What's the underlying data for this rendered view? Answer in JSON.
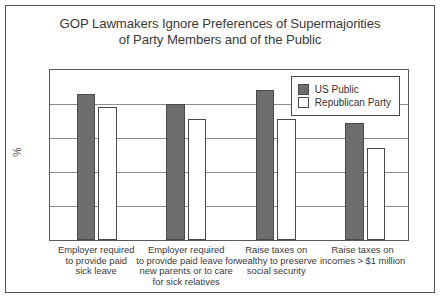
{
  "chart_data": {
    "type": "bar",
    "title": "GOP Lawmakers Ignore Preferences of Supermajorities of Party Members and of the Public",
    "title_lines": [
      "GOP Lawmakers Ignore Preferences of Supermajorities",
      "of Party Members and of the Public"
    ],
    "xlabel": "",
    "ylabel": "%",
    "ylim": [
      0,
      100
    ],
    "yticks": [
      0,
      20,
      40,
      60,
      80,
      100
    ],
    "grid": true,
    "legend_position": "top-right inside plot",
    "categories": [
      "Employer required to provide paid sick leave",
      "Employer required to provide paid leave for new parents or to care for sick relatives",
      "Raise taxes on wealthy to preserve social security",
      "Raise taxes on incomes > $1 million"
    ],
    "category_lines": [
      [
        "Employer required",
        "to provide paid",
        "sick leave"
      ],
      [
        "Employer required",
        "to provide paid leave for",
        "new parents or to care",
        "for sick relatives"
      ],
      [
        "Raise taxes on",
        "wealthy to preserve",
        "social security"
      ],
      [
        "Raise taxes on",
        "incomes > $1 million"
      ]
    ],
    "series": [
      {
        "name": "US Public",
        "color": "#6e6e6e",
        "values": [
          86,
          80,
          88,
          69
        ]
      },
      {
        "name": "Republican Party",
        "color": "#ffffff",
        "values": [
          78,
          71,
          71,
          54
        ]
      }
    ]
  }
}
